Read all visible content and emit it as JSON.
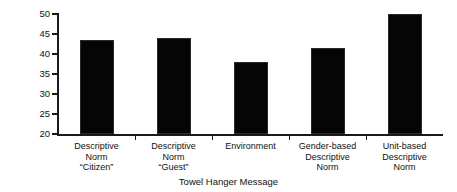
{
  "chart_data": {
    "type": "bar",
    "title": "",
    "xlabel": "Towel Hanger Message",
    "ylabel": "Participation (%)",
    "categories": [
      "Descriptive\nNorm\n“Citizen”",
      "Descriptive\nNorm\n“Guest”",
      "Environment",
      "Gender-based\nDescriptive\nNorm",
      "Unit-based\nDescriptive\nNorm"
    ],
    "values": [
      43.5,
      44,
      38,
      41.5,
      50
    ],
    "ylim": [
      20,
      50
    ],
    "yticks": [
      20,
      25,
      30,
      35,
      40,
      45,
      50
    ],
    "ytick_labels": [
      "20",
      "25",
      "30",
      "35",
      "40",
      "45",
      "50"
    ],
    "grid": false,
    "legend": "none",
    "bar_color": "#050505",
    "axis_color": "#1a1a1a",
    "background_color": "#ffffff"
  }
}
